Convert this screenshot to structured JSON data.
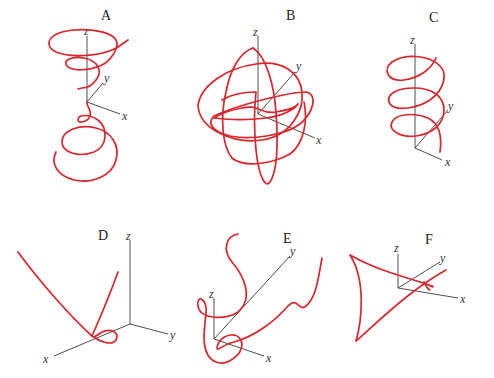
{
  "figure": {
    "curve_color": "#d7262c",
    "axis_color": "#3a3a3a",
    "panels": [
      {
        "label": "A",
        "axes": {
          "x": "x",
          "y": "y",
          "z": "z"
        },
        "curve_shape": "double conical helix (spiral narrowing toward origin from above and below)"
      },
      {
        "label": "B",
        "axes": {
          "x": "x",
          "y": "y",
          "z": "z"
        },
        "curve_shape": "closed curve on a sphere-like surface with intersecting loops"
      },
      {
        "label": "C",
        "axes": {
          "x": "x",
          "y": "y",
          "z": "z"
        },
        "curve_shape": "circular helix along z-axis"
      },
      {
        "label": "D",
        "axes": {
          "x": "x",
          "y": "y",
          "z": "z"
        },
        "curve_shape": "curve with single small loop near x-axis"
      },
      {
        "label": "E",
        "axes": {
          "x": "x",
          "y": "y",
          "z": "z"
        },
        "curve_shape": "wavy curve with loops"
      },
      {
        "label": "F",
        "axes": {
          "x": "x",
          "y": "y",
          "z": "z"
        },
        "curve_shape": "cusped curve (deltoid-like) with small cusp loop"
      }
    ]
  }
}
